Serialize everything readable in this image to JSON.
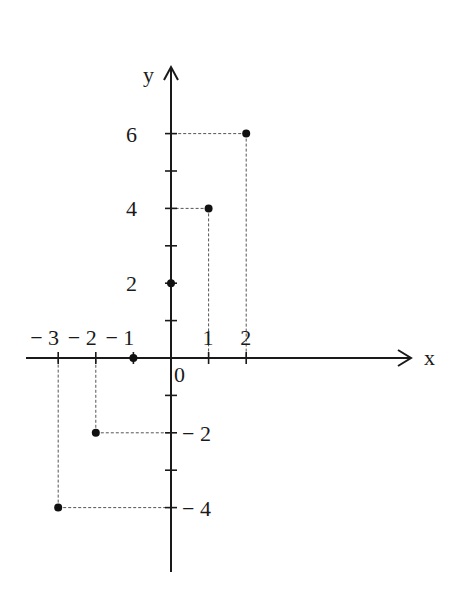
{
  "chart_data": {
    "type": "scatter",
    "title": "",
    "xlabel": "x",
    "ylabel": "y",
    "origin_label": "0",
    "x_ticks": [
      -3,
      -2,
      -1,
      1,
      2
    ],
    "x_tick_labels": [
      "− 3",
      "− 2",
      "− 1",
      "1",
      "2"
    ],
    "y_ticks": [
      -4,
      -3,
      -2,
      -1,
      1,
      2,
      3,
      4,
      5,
      6
    ],
    "y_tick_labels": [
      {
        "value": 6,
        "label": "6"
      },
      {
        "value": 4,
        "label": "4"
      },
      {
        "value": 2,
        "label": "2"
      },
      {
        "value": -2,
        "label": "− 2"
      },
      {
        "value": -4,
        "label": "− 4"
      }
    ],
    "series": [
      {
        "name": "points",
        "x": [
          -3,
          -2,
          -1,
          0,
          1,
          2
        ],
        "y": [
          -4,
          -2,
          0,
          2,
          4,
          6
        ]
      }
    ],
    "dashed_projections": true,
    "xlim": [
      -3.3,
      6.4
    ],
    "ylim": [
      -5.7,
      7.8
    ],
    "grid": false,
    "legend": null
  }
}
